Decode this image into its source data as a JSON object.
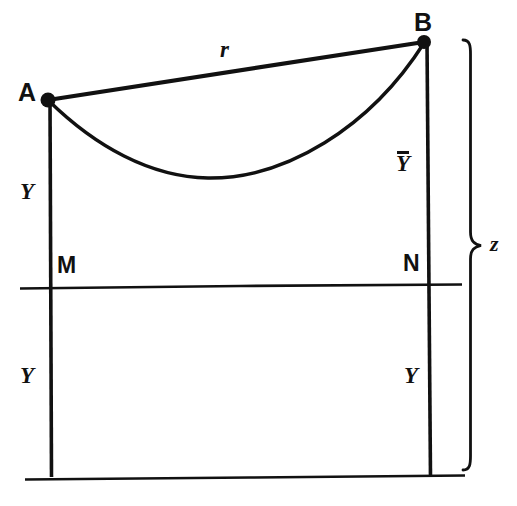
{
  "figure": {
    "background_color": "#ffffff",
    "ink_color": "#111111",
    "width": 517,
    "height": 506
  },
  "labels": {
    "point_a": "A",
    "point_b": "B",
    "point_m": "M",
    "point_n": "N",
    "chord_r": "r",
    "left_upper_y": "Y",
    "left_lower_y": "Y",
    "right_lower_y": "Y",
    "right_upper_ybar": "Y",
    "brace_z": "z"
  },
  "geometry": {
    "point_a": {
      "x": 47,
      "y": 99
    },
    "point_b": {
      "x": 424,
      "y": 41
    },
    "curve_lowest_point": {
      "x": 205,
      "y": 177
    },
    "left_vertical": {
      "x": 51,
      "y_top": 99,
      "y_bottom": 477
    },
    "right_vertical": {
      "x": 429,
      "y_top": 41,
      "y_bottom": 477
    },
    "middle_horizontal": {
      "y": 286,
      "x_left": 20,
      "x_right": 462
    },
    "bottom_horizontal": {
      "y": 477,
      "x_left": 25,
      "x_right": 465
    },
    "brace": {
      "x": 465,
      "y_top": 40,
      "y_bottom": 472,
      "peak_x": 489,
      "peak_y": 246
    }
  }
}
